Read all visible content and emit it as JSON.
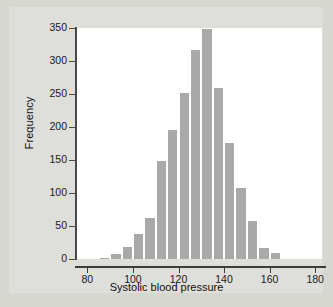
{
  "chart_data": {
    "type": "bar",
    "title": "",
    "subtitle": "",
    "xlabel": "Systolic blood pressure",
    "ylabel": "Frequency",
    "xlim": [
      75,
      183
    ],
    "ylim": [
      0,
      350
    ],
    "xticks": [
      80,
      100,
      120,
      140,
      160,
      180
    ],
    "xtick_labels": [
      "80",
      "100",
      "120",
      "140",
      "160",
      "180"
    ],
    "yticks": [
      0,
      50,
      100,
      150,
      200,
      250,
      300,
      350
    ],
    "ytick_labels": [
      "0",
      "50",
      "100",
      "150",
      "200",
      "250",
      "300",
      "350"
    ],
    "grid": false,
    "legend": false,
    "bin_width": 5,
    "bar_color": "#a9a9a9",
    "plot_background": "#ffffff",
    "figure_background": "#d7d7d2",
    "categories": [
      85,
      90,
      95,
      100,
      105,
      110,
      115,
      120,
      125,
      130,
      135,
      140,
      145,
      150,
      155,
      160
    ],
    "values": [
      2,
      7,
      18,
      38,
      62,
      149,
      196,
      252,
      316,
      348,
      259,
      176,
      107,
      58,
      17,
      9
    ],
    "bins": [
      {
        "start": 85,
        "end": 90,
        "count": 2
      },
      {
        "start": 90,
        "end": 95,
        "count": 7
      },
      {
        "start": 95,
        "end": 100,
        "count": 18
      },
      {
        "start": 100,
        "end": 105,
        "count": 38
      },
      {
        "start": 105,
        "end": 110,
        "count": 62
      },
      {
        "start": 110,
        "end": 115,
        "count": 149
      },
      {
        "start": 115,
        "end": 120,
        "count": 196
      },
      {
        "start": 120,
        "end": 125,
        "count": 252
      },
      {
        "start": 125,
        "end": 130,
        "count": 316
      },
      {
        "start": 130,
        "end": 135,
        "count": 348
      },
      {
        "start": 135,
        "end": 140,
        "count": 259
      },
      {
        "start": 140,
        "end": 145,
        "count": 176
      },
      {
        "start": 145,
        "end": 150,
        "count": 107
      },
      {
        "start": 150,
        "end": 155,
        "count": 58
      },
      {
        "start": 155,
        "end": 160,
        "count": 17
      },
      {
        "start": 160,
        "end": 165,
        "count": 9
      }
    ]
  }
}
